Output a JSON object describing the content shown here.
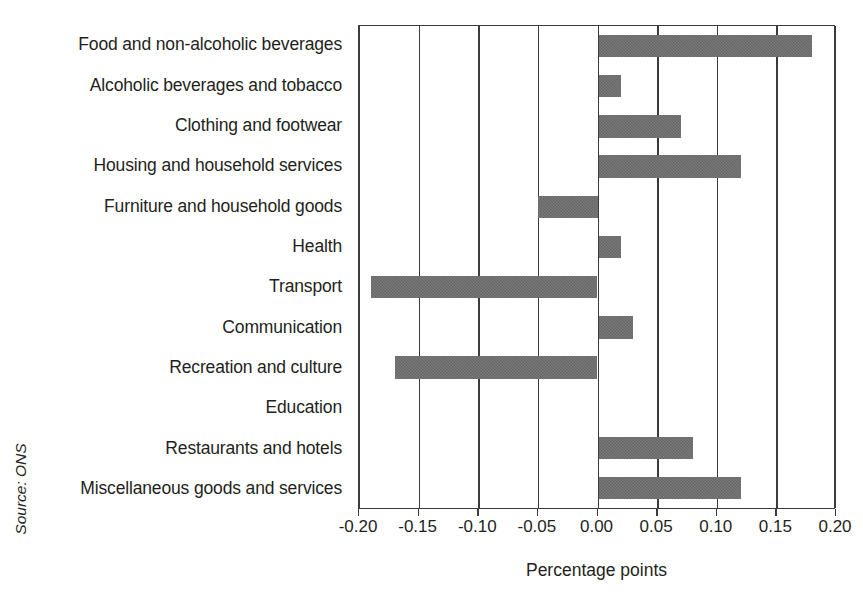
{
  "source_note": "Source: ONS",
  "chart_data": {
    "type": "bar",
    "orientation": "horizontal",
    "title": "",
    "xlabel": "Percentage points",
    "ylabel": "",
    "xlim": [
      -0.2,
      0.2
    ],
    "xticks": [
      -0.2,
      -0.15,
      -0.1,
      -0.05,
      0.0,
      0.05,
      0.1,
      0.15,
      0.2
    ],
    "xticklabels": [
      "-0.20",
      "-0.15",
      "-0.10",
      "-0.05",
      "0.00",
      "0.05",
      "0.10",
      "0.15",
      "0.20"
    ],
    "grid": true,
    "legend": false,
    "bar_color": "#6a6a6a",
    "axis_color": "#3b3b3b",
    "categories": [
      "Food and non-alcoholic beverages",
      "Alcoholic beverages and tobacco",
      "Clothing and footwear",
      "Housing and household services",
      "Furniture and household goods",
      "Health",
      "Transport",
      "Communication",
      "Recreation and culture",
      "Education",
      "Restaurants and hotels",
      "Miscellaneous goods and services"
    ],
    "values": [
      0.18,
      0.02,
      0.07,
      0.12,
      -0.05,
      0.02,
      -0.19,
      0.03,
      -0.17,
      0.0,
      0.08,
      0.12
    ]
  }
}
